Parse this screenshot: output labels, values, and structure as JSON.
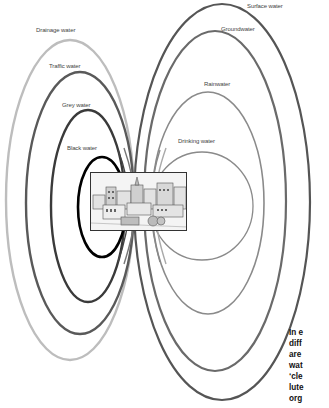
{
  "diagram": {
    "labels": {
      "drainage": "Drainage water",
      "traffic": "Traffic water",
      "grey": "Grey water",
      "black": "Black water",
      "surface": "Surface water",
      "ground": "Groundwater",
      "rain": "Rainwater",
      "drinking": "Drinking water"
    },
    "ellipses": [
      {
        "id": "surface",
        "label": "Surface water",
        "cx": 222,
        "cy": 202,
        "rx": 88,
        "ry": 198,
        "stroke": "#555555",
        "width": 2.2
      },
      {
        "id": "ground",
        "label": "Groundwater",
        "cx": 215,
        "cy": 201,
        "rx": 71,
        "ry": 170,
        "stroke": "#6a6a6a",
        "width": 2.2
      },
      {
        "id": "rain",
        "label": "Rainwater",
        "cx": 208,
        "cy": 203,
        "rx": 56,
        "ry": 111,
        "stroke": "#8a8a8a",
        "width": 1.6
      },
      {
        "id": "drinking",
        "label": "Drinking water",
        "cx": 202,
        "cy": 206,
        "rx": 51,
        "ry": 54,
        "stroke": "#8a8a8a",
        "width": 1.3
      },
      {
        "id": "drainage",
        "label": "Drainage water",
        "cx": 70,
        "cy": 200,
        "rx": 64,
        "ry": 160,
        "stroke": "#bdbdbd",
        "width": 2.4
      },
      {
        "id": "traffic",
        "label": "Traffic water",
        "cx": 80,
        "cy": 203,
        "rx": 54,
        "ry": 131,
        "stroke": "#595959",
        "width": 2.4
      },
      {
        "id": "grey",
        "label": "Grey water",
        "cx": 88,
        "cy": 206,
        "rx": 37,
        "ry": 96,
        "stroke": "#3a3a3a",
        "width": 2.4
      },
      {
        "id": "black",
        "label": "Black water",
        "cx": 102,
        "cy": 207,
        "rx": 24,
        "ry": 50,
        "stroke": "#000000",
        "width": 2.6
      }
    ],
    "caption_lines": [
      "In e",
      "diff",
      "are",
      "wat",
      "‘cle",
      "lute",
      "org"
    ],
    "illustration": "town-sketch"
  }
}
